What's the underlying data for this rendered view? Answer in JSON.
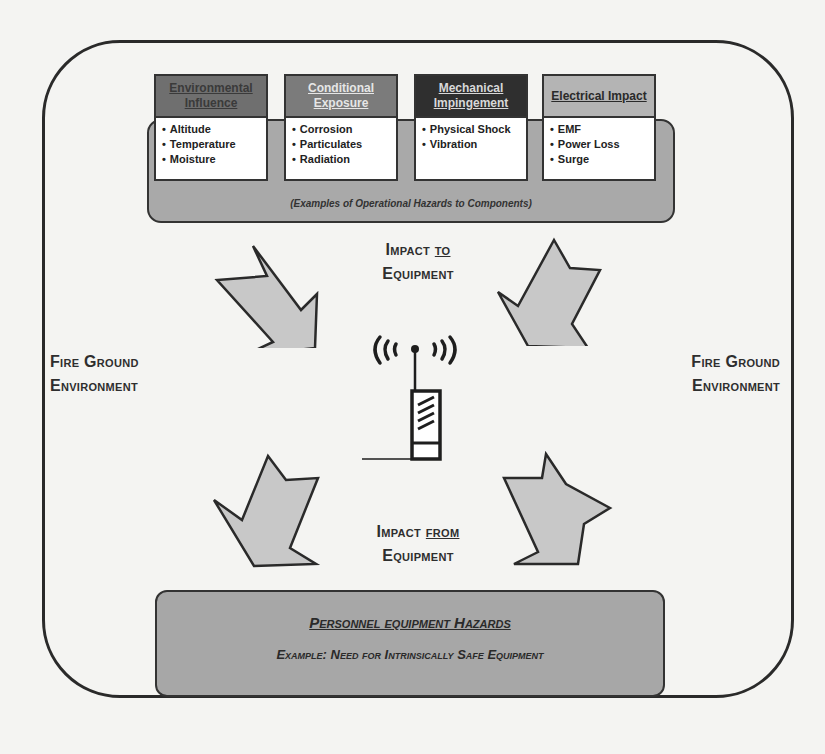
{
  "diagram": {
    "operational_hazards": {
      "caption": "(Examples of Operational Hazards to Components)",
      "fill_color": "#a9a9a9",
      "categories": [
        {
          "title": "Environmental Influence",
          "header_color": "#6f6f6f",
          "title_color": "#3a3a3a",
          "items": [
            "Altitude",
            "Temperature",
            "Moisture"
          ]
        },
        {
          "title": "Conditional Exposure",
          "header_color": "#7b7b7b",
          "title_color": "#e6e6e6",
          "items": [
            "Corrosion",
            "Particulates",
            "Radiation"
          ]
        },
        {
          "title": "Mechanical Impingement",
          "header_color": "#2f2f2f",
          "title_color": "#d8d8d8",
          "items": [
            "Physical Shock",
            "Vibration"
          ]
        },
        {
          "title": "Electrical Impact",
          "header_color": "#b4b4b4",
          "title_color": "#2a2a2a",
          "items": [
            "EMF",
            "Power Loss",
            "Surge"
          ]
        }
      ]
    },
    "impact_to": {
      "prefix": "Impact ",
      "emphasis": "to",
      "line2": "Equipment"
    },
    "impact_from": {
      "prefix": "Impact ",
      "emphasis": "from",
      "line2": "Equipment"
    },
    "left_environment": {
      "line1": "Fire Ground",
      "line2": "Environment"
    },
    "right_environment": {
      "line1": "Fire Ground",
      "line2": "Environment"
    },
    "center_icon": "radio-transmitter-icon",
    "personnel": {
      "title": "Personnel equipment Hazards",
      "example": "Example: Need for Intrinsically Safe Equipment",
      "fill_color": "#a7a7a7"
    },
    "arrows": [
      {
        "name": "arrow-top-left",
        "direction": "down-right"
      },
      {
        "name": "arrow-top-right",
        "direction": "down-left"
      },
      {
        "name": "arrow-bottom-left",
        "direction": "down-left"
      },
      {
        "name": "arrow-bottom-right",
        "direction": "down-right"
      }
    ],
    "arrow_fill": "#c8c8c8",
    "stroke_color": "#2a2a2a"
  }
}
